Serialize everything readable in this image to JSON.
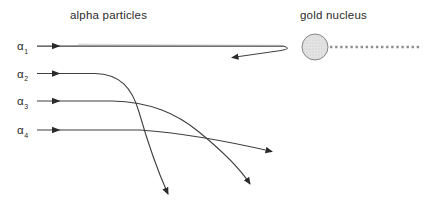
{
  "labels": {
    "beam_title": "alpha particles",
    "target_title": "gold nucleus"
  },
  "particles": [
    {
      "symbol": "α",
      "subscript": "1"
    },
    {
      "symbol": "α",
      "subscript": "2"
    },
    {
      "symbol": "α",
      "subscript": "3"
    },
    {
      "symbol": "α",
      "subscript": "4"
    }
  ],
  "colors": {
    "trajectory": "#3f3f3f",
    "arrow": "#2a2a2a",
    "text": "#2b2b2b",
    "nucleus_fill": "#e3e3e3",
    "nucleus_speckle": "#c8c8c8",
    "nucleus_stroke": "#858585",
    "dotted_line": "#8f8f8f",
    "ghost_line": "#bbbbbb"
  },
  "geometry": {
    "trajectories": {
      "alpha1_incoming": "M37 46 H283",
      "alpha1_ghost": "M78 44.4 L280 45.2",
      "alpha1_return": "M283 46 Q293 48.5 281 50.5 L232 57.5",
      "alpha2": "M37 73.5 H95 C120 74 132 88 139 112 C147 140 159 174 168 194",
      "alpha3": "M37 101 H112 C150 102 176 113 199 132 C221 150 241 170 250 184",
      "alpha4": "M37 130 H140 C175 132.5 220 139.5 272 151.5"
    },
    "launch_arrows": [
      "M52 42.8 L60.5 46 L52 49.2 Z",
      "M52 70.3 L60.5 73.5 L52 76.7 Z",
      "M52 97.8 L60.5 101 L52 104.2 Z",
      "M52 126.8 L60.5 130 L52 133.2 Z"
    ],
    "nucleus": {
      "cx": "315",
      "cy": "47",
      "r": "13"
    },
    "dotted_path": "M330 47 H420"
  }
}
